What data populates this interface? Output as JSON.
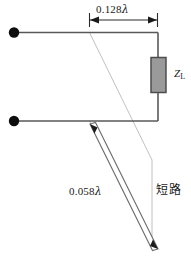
{
  "figure": {
    "type": "transmission-line-stub-matching-diagram",
    "background_color": "#ffffff",
    "line_color": "#555555",
    "thin_line_color": "#bbbbbb",
    "terminal_color": "#000000",
    "load_fill_color": "#9a9a9a",
    "load_stroke_color": "#4d4d4d"
  },
  "labels": {
    "distance_to_load": "0.128",
    "distance_to_load_unit": "λ",
    "stub_length": "0.058",
    "stub_length_unit": "λ",
    "short_circuit": "短路",
    "load_impedance": "Z",
    "load_impedance_sub": "L"
  },
  "icons": {
    "terminal_top": "terminal-dot-icon",
    "terminal_bottom": "terminal-dot-icon",
    "dimension_arrow_left": "arrow-left-icon",
    "dimension_arrow_right": "arrow-right-icon",
    "stub_arrow_top": "arrow-up-icon",
    "stub_arrow_bottom": "arrow-down-icon"
  }
}
